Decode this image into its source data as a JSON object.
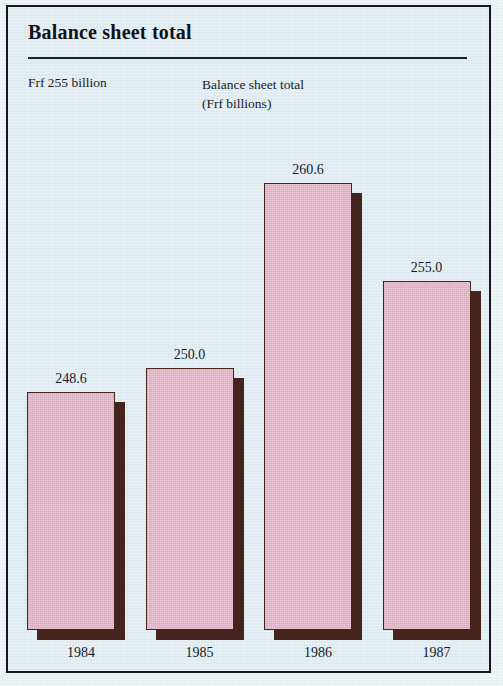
{
  "figure": {
    "title": "Balance sheet total",
    "subtitle_left": "Frf 255 billion",
    "subtitle_right_line1": "Balance sheet total",
    "subtitle_right_line2": "(Frf billions)",
    "background_color": "#dce9ef",
    "bar_color": "#e5b4c8",
    "bar_outline_color": "#46241e",
    "shadow_color": "#46241e",
    "frame_color": "#14181c"
  },
  "chart_data": {
    "type": "bar",
    "title": "Balance sheet total",
    "xlabel": "",
    "ylabel": "Balance sheet total (Frf billions)",
    "categories": [
      "1984",
      "1985",
      "1986",
      "1987"
    ],
    "values": [
      248.6,
      250.0,
      260.6,
      255.0
    ],
    "value_labels": [
      "248.6",
      "250.0",
      "260.6",
      "255.0"
    ],
    "ylim": [
      235.0,
      263.0
    ],
    "grid": false,
    "legend": "none",
    "series": [
      {
        "name": "Balance sheet total",
        "values": [
          248.6,
          250.0,
          260.6,
          255.0
        ]
      }
    ]
  }
}
